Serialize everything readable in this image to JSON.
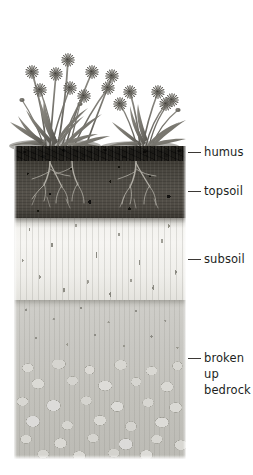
{
  "figure": {
    "type": "soil-profile-diagram",
    "title": ""
  },
  "labels": [
    {
      "id": "humus",
      "text": "humus",
      "lines": [
        "humus"
      ]
    },
    {
      "id": "topsoil",
      "text": "topsoil",
      "lines": [
        "topsoil"
      ]
    },
    {
      "id": "subsoil",
      "text": "subsoil",
      "lines": [
        "subsoil"
      ]
    },
    {
      "id": "bedrock",
      "text": "broken up bedrock",
      "lines": [
        "broken",
        "up",
        "bedrock"
      ]
    }
  ],
  "layers": [
    {
      "id": "humus",
      "name": "humus",
      "color": "#1a1916"
    },
    {
      "id": "topsoil",
      "name": "topsoil",
      "color": "#4f4b44"
    },
    {
      "id": "subsoil",
      "name": "subsoil",
      "color": "#f2f1ed"
    },
    {
      "id": "bedrock",
      "name": "broken up bedrock",
      "color": "#c6c5c0"
    }
  ],
  "vegetation": {
    "name": "flowering plants",
    "flower_count": 14,
    "color": "#6e6c66"
  },
  "colors": {
    "background": "#ffffff",
    "text": "#221f1d",
    "leader_line": "#3b3835"
  }
}
